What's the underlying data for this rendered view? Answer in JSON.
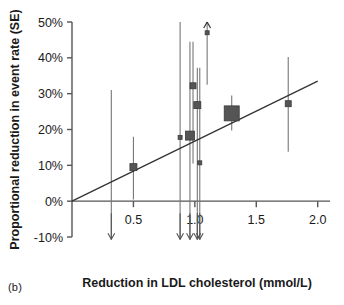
{
  "figure": {
    "panel_label": "(b)",
    "xlabel": "Reduction in LDL cholesterol (mmol/L)",
    "ylabel": "Proportional reduction in event rate (SE)"
  },
  "chart_data": {
    "type": "scatter",
    "title": "",
    "xlabel": "Reduction in LDL cholesterol (mmol/L)",
    "ylabel": "Proportional reduction in event rate (SE)",
    "xlim": [
      0.0,
      2.1
    ],
    "ylim": [
      -0.1,
      0.5
    ],
    "xticks": [
      0.5,
      1.0,
      1.5,
      2.0
    ],
    "xticklabels": [
      "0.5",
      "1.0",
      "1.5",
      "2.0"
    ],
    "yticks": [
      -0.1,
      0.0,
      0.1,
      0.2,
      0.3,
      0.4,
      0.5
    ],
    "yticklabels": [
      "-10%",
      "0%",
      "10%",
      "20%",
      "30%",
      "40%",
      "50%"
    ],
    "grid": false,
    "legend": null,
    "marker_color": "#555555",
    "errorbar_color": "#777777",
    "line_color": "#333333",
    "axis_color": "#555555",
    "regression_line": {
      "label": "fitted meta-regression through origin",
      "x": [
        0.0,
        2.0
      ],
      "y": [
        0.0,
        0.335
      ]
    },
    "points": [
      {
        "id": "study-1",
        "x": 0.32,
        "y": 0.155,
        "ylow": -0.105,
        "yhigh": 0.31,
        "marker_size": 0,
        "arrow_down": true,
        "arrow_up": false,
        "label": ""
      },
      {
        "id": "study-2",
        "x": 0.5,
        "y": 0.095,
        "ylow": 0.005,
        "yhigh": 0.18,
        "marker_size": 7,
        "arrow_down": false,
        "arrow_up": false,
        "label": ""
      },
      {
        "id": "study-3",
        "x": 0.88,
        "y": 0.178,
        "ylow": -0.105,
        "yhigh": 0.5,
        "marker_size": 4,
        "arrow_down": true,
        "arrow_up": false,
        "label": ""
      },
      {
        "id": "study-4",
        "x": 0.96,
        "y": 0.183,
        "ylow": -0.105,
        "yhigh": 0.445,
        "marker_size": 9,
        "arrow_down": true,
        "arrow_up": false,
        "label": ""
      },
      {
        "id": "study-5",
        "x": 0.985,
        "y": 0.322,
        "ylow": 0.105,
        "yhigh": 0.445,
        "marker_size": 6,
        "arrow_down": false,
        "arrow_up": false,
        "label": ""
      },
      {
        "id": "study-6",
        "x": 1.02,
        "y": 0.268,
        "ylow": -0.105,
        "yhigh": 0.372,
        "marker_size": 7,
        "arrow_down": true,
        "arrow_up": false,
        "label": ""
      },
      {
        "id": "study-7",
        "x": 1.04,
        "y": 0.107,
        "ylow": -0.105,
        "yhigh": 0.372,
        "marker_size": 4,
        "arrow_down": true,
        "arrow_up": false,
        "label": ""
      },
      {
        "id": "study-8",
        "x": 1.1,
        "y": 0.47,
        "ylow": 0.325,
        "yhigh": 0.525,
        "marker_size": 4,
        "arrow_down": false,
        "arrow_up": true,
        "label": ""
      },
      {
        "id": "study-9",
        "x": 1.3,
        "y": 0.245,
        "ylow": 0.197,
        "yhigh": 0.295,
        "marker_size": 15,
        "arrow_down": false,
        "arrow_up": false,
        "label": ""
      },
      {
        "id": "study-10",
        "x": 1.76,
        "y": 0.272,
        "ylow": 0.138,
        "yhigh": 0.402,
        "marker_size": 6,
        "arrow_down": false,
        "arrow_up": false,
        "label": ""
      }
    ]
  }
}
